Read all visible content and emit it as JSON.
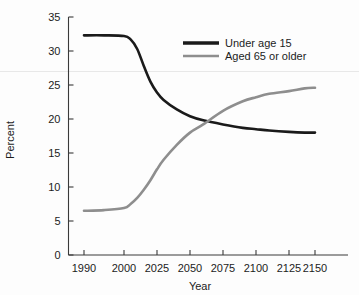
{
  "chart_data": {
    "type": "line",
    "title": "",
    "subtitle": "",
    "xlabel": "Year",
    "ylabel": "Percent",
    "xlim": [
      1985,
      2160
    ],
    "ylim": [
      0,
      35
    ],
    "grid": false,
    "legend_position": "top-right",
    "x_tick_labels": [
      "1990",
      "2000",
      "2025",
      "2050",
      "2075",
      "2100",
      "2125",
      "2150"
    ],
    "x_tick_values": [
      1990,
      2000,
      2025,
      2050,
      2075,
      2100,
      2125,
      2150
    ],
    "y_tick_labels": [
      "0",
      "5",
      "10",
      "15",
      "20",
      "25",
      "30",
      "35"
    ],
    "y_tick_values": [
      0,
      5,
      10,
      15,
      20,
      25,
      30,
      35
    ],
    "series": [
      {
        "name": "Under age 15",
        "color": "#1a1a1a",
        "width": 2.6,
        "x": [
          1990,
          1995,
          2000,
          2005,
          2010,
          2015,
          2020,
          2025,
          2030,
          2040,
          2050,
          2060,
          2075,
          2090,
          2100,
          2110,
          2125,
          2140,
          2150
        ],
        "values": [
          32.3,
          32.3,
          32.2,
          31.7,
          30.3,
          27.8,
          25.5,
          23.9,
          22.8,
          21.4,
          20.4,
          19.8,
          19.2,
          18.7,
          18.5,
          18.3,
          18.1,
          18.0,
          18.0
        ]
      },
      {
        "name": "Aged 65 or older",
        "color": "#8e8e8e",
        "width": 2.6,
        "x": [
          1990,
          1995,
          2000,
          2005,
          2010,
          2015,
          2020,
          2025,
          2030,
          2040,
          2050,
          2060,
          2075,
          2090,
          2100,
          2110,
          2125,
          2140,
          2150
        ],
        "values": [
          6.5,
          6.6,
          6.9,
          7.5,
          8.4,
          9.6,
          11.0,
          12.6,
          14.0,
          16.2,
          18.0,
          19.2,
          21.2,
          22.6,
          23.2,
          23.7,
          24.1,
          24.5,
          24.6
        ]
      }
    ],
    "legend_entries": [
      {
        "label": "Under age 15",
        "color": "#1a1a1a"
      },
      {
        "label": "Aged 65 or older",
        "color": "#8e8e8e"
      }
    ],
    "annotations": [],
    "crossover": {
      "year": 2071,
      "value": 19.3
    }
  },
  "colors": {
    "under15": "#1a1a1a",
    "aged65": "#8e8e8e",
    "axis": "#3a3a3a",
    "text": "#1c1c1c",
    "background": "#fdfdfd"
  }
}
